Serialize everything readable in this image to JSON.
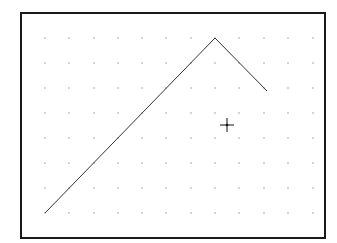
{
  "canvas": {
    "width": 337,
    "height": 243,
    "background": "#ffffff"
  },
  "frame": {
    "x": 21,
    "y": 13,
    "width": 304,
    "height": 225,
    "stroke": "#1a1a1a",
    "stroke_width": 2
  },
  "grid": {
    "dot_color": "#8a8a8a",
    "dot_size": 1.2,
    "columns": [
      45,
      69,
      94,
      118,
      142,
      166,
      191,
      215,
      239,
      264,
      288,
      313
    ],
    "rows": [
      38,
      63,
      88,
      113,
      138,
      163,
      188,
      213
    ]
  },
  "polyline": {
    "stroke": "#333333",
    "stroke_width": 1,
    "points": [
      [
        45,
        213
      ],
      [
        215,
        38
      ],
      [
        267,
        91
      ]
    ]
  },
  "cursor": {
    "type": "crosshair",
    "icon": "crosshair-icon",
    "x": 227,
    "y": 125,
    "arm": 7,
    "stroke": "#111111"
  }
}
